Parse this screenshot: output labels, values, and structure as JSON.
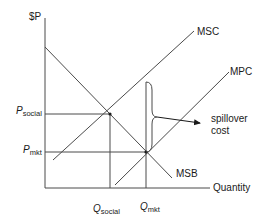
{
  "diagram": {
    "y_axis_label": "$P",
    "x_axis_label": "Quantity",
    "curves": [
      {
        "name": "MSC",
        "label": "MSC"
      },
      {
        "name": "MPC",
        "label": "MPC"
      },
      {
        "name": "MSB",
        "label": "MSB"
      }
    ],
    "price_levels": {
      "social": {
        "main": "P",
        "sub": "social"
      },
      "market": {
        "main": "P",
        "sub": "mkt"
      }
    },
    "quantity_levels": {
      "social": {
        "main": "Q",
        "sub": "social"
      },
      "market": {
        "main": "Q",
        "sub": "mkt"
      }
    },
    "annotation": {
      "line1": "spillover",
      "line2": "cost"
    },
    "colors": {
      "line": "#4a4a4a",
      "text": "#1a1a1a",
      "background": "#ffffff"
    }
  }
}
